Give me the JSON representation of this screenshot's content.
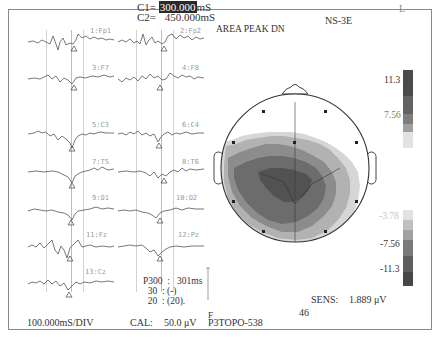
{
  "header": {
    "c1_label": "C1=",
    "c1_value": "300.000",
    "c1_unit": "mS",
    "c2_label": "C2=",
    "c2_value": "450.000",
    "c2_unit": "mS",
    "device": "NS-3E",
    "side_marker": "L",
    "map_mode": "AREA PEAK DN"
  },
  "channels": [
    {
      "id": "1",
      "name": "Fp1",
      "label": "1:Fp1"
    },
    {
      "id": "2",
      "name": "Fp2",
      "label": "2:Fp2"
    },
    {
      "id": "3",
      "name": "F7",
      "label": "3:F7"
    },
    {
      "id": "4",
      "name": "F8",
      "label": "4:F8"
    },
    {
      "id": "5",
      "name": "C3",
      "label": "5:C3"
    },
    {
      "id": "6",
      "name": "C4",
      "label": "6:C4"
    },
    {
      "id": "7",
      "name": "T5",
      "label": "7:T5"
    },
    {
      "id": "8",
      "name": "T6",
      "label": "8:T6"
    },
    {
      "id": "9",
      "name": "O1",
      "label": "9:O1"
    },
    {
      "id": "10",
      "name": "O2",
      "label": "10:O2"
    },
    {
      "id": "11",
      "name": "Fz",
      "label": "11:Fz"
    },
    {
      "id": "12",
      "name": "Pz",
      "label": "12:Pz"
    },
    {
      "id": "13",
      "name": "Cz",
      "label": "13:Cz"
    }
  ],
  "results": {
    "row1_label": "P300",
    "row1_sep": ":",
    "row1_value": "301ms",
    "row2_label": "30",
    "row2_sep": ":",
    "row2_value": "(-)",
    "row3_label": "20",
    "row3_sep": ":",
    "row3_value": "(20)."
  },
  "footer": {
    "timebase": "100.000mS/DIV",
    "cal_label": "CAL:",
    "cal_value": "50.0 μV",
    "file_id": "P3TOPO-538",
    "page_number": "46",
    "sens_label": "SENS:",
    "sens_value": "1.889 μV",
    "cal_marker": "F"
  },
  "colorscale": {
    "ticks": [
      "11.3",
      "7.56",
      "-3.78",
      "-7.56",
      "-11.3"
    ],
    "positive_colors": [
      "#4a4a4a",
      "#626262",
      "#7d7d7d",
      "#9d9d9d",
      "#e0e0e0"
    ],
    "negative_colors": [
      "#e0e0e0",
      "#b5b5b5",
      "#9a9a9a",
      "#7a7a7a",
      "#5e5e5e",
      "#464646"
    ]
  },
  "topomap": {
    "electrode_count": 13,
    "colors": {
      "darkest": "#525252",
      "dark": "#6c6c6c",
      "mid": "#8c8c8c",
      "light": "#b2b2b2",
      "lightest": "#d6d6d6"
    }
  }
}
